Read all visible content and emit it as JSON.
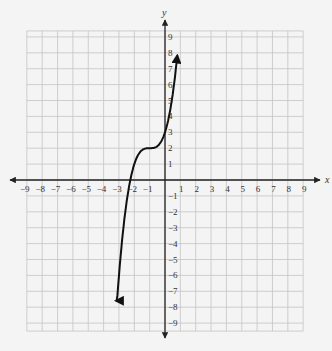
{
  "chart_data": {
    "type": "line",
    "title": "",
    "xlabel": "x",
    "ylabel": "y",
    "xlim": [
      -9,
      9
    ],
    "ylim": [
      -9,
      9
    ],
    "grid": true,
    "x_ticks": [
      -9,
      -8,
      -7,
      -6,
      -5,
      -4,
      -3,
      -2,
      -1,
      1,
      2,
      3,
      4,
      5,
      6,
      7,
      8,
      9
    ],
    "y_ticks": [
      -9,
      -8,
      -7,
      -6,
      -5,
      -4,
      -3,
      -2,
      -1,
      1,
      2,
      3,
      4,
      5,
      6,
      7,
      8,
      9
    ],
    "series": [
      {
        "name": "cubic curve (approx. y = (x+1)^3 + 2)",
        "x": [
          -3.2,
          -3.0,
          -2.5,
          -2.26,
          -2.0,
          -1.5,
          -1.0,
          -0.5,
          0.0,
          0.3,
          0.5,
          0.7,
          0.8
        ],
        "y": [
          -7.0,
          -6.0,
          -1.4,
          0.0,
          1.0,
          1.9,
          2.0,
          2.1,
          3.0,
          4.2,
          5.4,
          6.9,
          8.8
        ],
        "arrows_at_both_ends": true
      }
    ],
    "key_points": [
      {
        "label": "y-intercept",
        "x": 0,
        "y": 3
      },
      {
        "label": "inflection point",
        "x": -1,
        "y": 2
      },
      {
        "label": "x-intercept",
        "x": -2.26,
        "y": 0
      }
    ]
  },
  "axes": {
    "x_label": "x",
    "y_label": "y"
  }
}
